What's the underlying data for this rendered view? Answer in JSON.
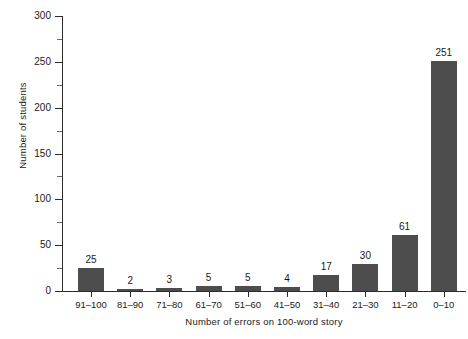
{
  "chart_data": {
    "type": "bar",
    "title": "",
    "xlabel": "Number of errors on 100-word story",
    "ylabel": "Number of students",
    "categories": [
      "91–100",
      "81–90",
      "71–80",
      "61–70",
      "51–60",
      "41–50",
      "31–40",
      "21–30",
      "11–20",
      "0–10"
    ],
    "values": [
      25,
      2,
      3,
      5,
      5,
      4,
      17,
      30,
      61,
      251
    ],
    "value_labels": [
      "25",
      "2",
      "3",
      "5",
      "5",
      "4",
      "17",
      "30",
      "61",
      "251"
    ],
    "ylim": [
      0,
      300
    ],
    "ytick_labels": [
      "0",
      "50",
      "100",
      "150",
      "200",
      "250",
      "300"
    ],
    "ytick_values": [
      0,
      50,
      100,
      150,
      200,
      250,
      300
    ],
    "yminor_values": [
      25,
      75,
      125,
      175,
      225,
      275
    ],
    "grid": false,
    "legend": false,
    "legend_position": "none",
    "bar_color": "#4d4d4d",
    "axis_color": "#2b2b2b",
    "background_color": "#ffffff"
  }
}
